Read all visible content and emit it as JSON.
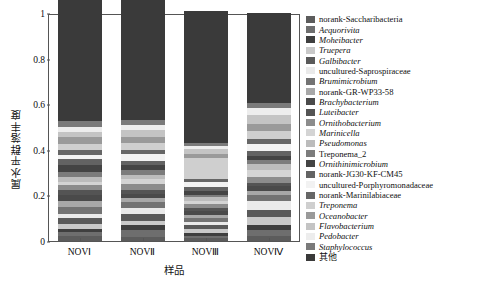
{
  "chart_data": {
    "type": "bar",
    "stacked": true,
    "title": "",
    "xlabel": "样品",
    "ylabel": "属水平群落丰度",
    "ylim": [
      0,
      1
    ],
    "ytick_labels": [
      "0",
      "0.2",
      "0.4",
      "0.6",
      "0.8",
      "1"
    ],
    "ytick_values": [
      0,
      0.2,
      0.4,
      0.6,
      0.8,
      1
    ],
    "grid": false,
    "legend_position": "right",
    "categories": [
      "NOVⅠ",
      "NOVⅡ",
      "NOVⅢ",
      "NOVⅣ"
    ],
    "series": [
      {
        "name": "norank-Saccharibacteria",
        "color": "#5c5c5c",
        "italic": false,
        "values": [
          0.02,
          0.018,
          0.012,
          0.022
        ]
      },
      {
        "name": "Aequorivita",
        "color": "#6e6e6e",
        "italic": true,
        "values": [
          0.018,
          0.03,
          0.01,
          0.028
        ]
      },
      {
        "name": "Moheibacter",
        "color": "#3f3f3f",
        "italic": true,
        "values": [
          0.016,
          0.022,
          0.014,
          0.02
        ]
      },
      {
        "name": "Truepera",
        "color": "#c9c9c9",
        "italic": true,
        "values": [
          0.022,
          0.016,
          0.018,
          0.034
        ]
      },
      {
        "name": "Galbibacter",
        "color": "#5a5a5a",
        "italic": true,
        "values": [
          0.026,
          0.034,
          0.016,
          0.03
        ]
      },
      {
        "name": "uncultured-Saprospiraceae",
        "color": "#eaeaea",
        "italic": false,
        "values": [
          0.018,
          0.024,
          0.012,
          0.04
        ]
      },
      {
        "name": "Brumimicrobium",
        "color": "#737373",
        "italic": true,
        "values": [
          0.03,
          0.026,
          0.02,
          0.026
        ]
      },
      {
        "name": "norank-GR-WP33-58",
        "color": "#a8a8a8",
        "italic": false,
        "values": [
          0.024,
          0.02,
          0.014,
          0.018
        ]
      },
      {
        "name": "Brachybacterium",
        "color": "#4a4a4a",
        "italic": true,
        "values": [
          0.028,
          0.018,
          0.016,
          0.022
        ]
      },
      {
        "name": "Luteibacter",
        "color": "#545454",
        "italic": true,
        "values": [
          0.02,
          0.014,
          0.012,
          0.016
        ]
      },
      {
        "name": "Ornithobacterium",
        "color": "#8c8c8c",
        "italic": true,
        "values": [
          0.022,
          0.028,
          0.018,
          0.024
        ]
      },
      {
        "name": "Marinicella",
        "color": "#d4d4d4",
        "italic": true,
        "values": [
          0.016,
          0.022,
          0.014,
          0.03
        ]
      },
      {
        "name": "Pseudomonas",
        "color": "#bcbcbc",
        "italic": true,
        "values": [
          0.02,
          0.018,
          0.016,
          0.026
        ]
      },
      {
        "name": "Treponema_2",
        "color": "#7c7c7c",
        "italic": false,
        "values": [
          0.024,
          0.02,
          0.012,
          0.02
        ]
      },
      {
        "name": "Ornithinimicrobium",
        "color": "#444444",
        "italic": true,
        "values": [
          0.03,
          0.024,
          0.014,
          0.018
        ]
      },
      {
        "name": "norank-JG30-KF-CM45",
        "color": "#636363",
        "italic": false,
        "values": [
          0.026,
          0.016,
          0.018,
          0.022
        ]
      },
      {
        "name": "uncultured-Porphyromonadaceae",
        "color": "#f2f2f2",
        "italic": false,
        "values": [
          0.018,
          0.03,
          0.022,
          0.028
        ]
      },
      {
        "name": "norank-Marinilabiaceae",
        "color": "#666666",
        "italic": false,
        "values": [
          0.022,
          0.018,
          0.016,
          0.024
        ]
      },
      {
        "name": "Treponema",
        "color": "#cfcfcf",
        "italic": true,
        "values": [
          0.026,
          0.034,
          0.09,
          0.036
        ]
      },
      {
        "name": "Oceanobacter",
        "color": "#9a9a9a",
        "italic": true,
        "values": [
          0.03,
          0.026,
          0.02,
          0.032
        ]
      },
      {
        "name": "Flavobacterium",
        "color": "#c4c4c4",
        "italic": true,
        "values": [
          0.024,
          0.03,
          0.018,
          0.038
        ]
      },
      {
        "name": "Pedobacter",
        "color": "#ededed",
        "italic": true,
        "values": [
          0.02,
          0.022,
          0.016,
          0.03
        ]
      },
      {
        "name": "Staphylococcus",
        "color": "#7a7a7a",
        "italic": true,
        "values": [
          0.026,
          0.02,
          0.014,
          0.022
        ]
      },
      {
        "name": "其他",
        "color": "#3a3a3a",
        "italic": false,
        "values": [
          0.554,
          0.57,
          0.578,
          0.394
        ]
      }
    ]
  },
  "legend": {
    "entries": [
      {
        "label": "norank-Saccharibacteria",
        "color": "#5c5c5c",
        "style": "roman"
      },
      {
        "label": "Aequorivita",
        "color": "#6e6e6e",
        "style": "italic"
      },
      {
        "label": "Moheibacter",
        "color": "#3f3f3f",
        "style": "italic"
      },
      {
        "label": "Truepera",
        "color": "#c9c9c9",
        "style": "italic"
      },
      {
        "label": "Galbibacter",
        "color": "#5a5a5a",
        "style": "italic"
      },
      {
        "label": "uncultured-Saprospiraceae",
        "color": "#eaeaea",
        "style": "roman"
      },
      {
        "label": "Brumimicrobium",
        "color": "#737373",
        "style": "italic"
      },
      {
        "label": "norank-GR-WP33-58",
        "color": "#a8a8a8",
        "style": "roman"
      },
      {
        "label": "Brachybacterium",
        "color": "#4a4a4a",
        "style": "italic"
      },
      {
        "label": "Luteibacter",
        "color": "#545454",
        "style": "italic"
      },
      {
        "label": "Ornithobacterium",
        "color": "#8c8c8c",
        "style": "italic"
      },
      {
        "label": "Marinicella",
        "color": "#d4d4d4",
        "style": "italic"
      },
      {
        "label": "Pseudomonas",
        "color": "#bcbcbc",
        "style": "italic"
      },
      {
        "label": "Treponema_2",
        "color": "#7c7c7c",
        "style": "roman"
      },
      {
        "label": "Ornithinimicrobium",
        "color": "#444444",
        "style": "italic"
      },
      {
        "label": "norank-JG30-KF-CM45",
        "color": "#636363",
        "style": "roman"
      },
      {
        "label": "uncultured-Porphyromonadaceae",
        "color": "#f2f2f2",
        "style": "roman"
      },
      {
        "label": "norank-Marinilabiaceae",
        "color": "#666666",
        "style": "roman"
      },
      {
        "label": "Treponema",
        "color": "#cfcfcf",
        "style": "italic"
      },
      {
        "label": "Oceanobacter",
        "color": "#9a9a9a",
        "style": "italic"
      },
      {
        "label": "Flavobacterium",
        "color": "#c4c4c4",
        "style": "italic"
      },
      {
        "label": "Pedobacter",
        "color": "#ededed",
        "style": "italic"
      },
      {
        "label": "Staphylococcus",
        "color": "#7a7a7a",
        "style": "italic"
      },
      {
        "label": "其他",
        "color": "#3a3a3a",
        "style": "cjk"
      }
    ]
  }
}
